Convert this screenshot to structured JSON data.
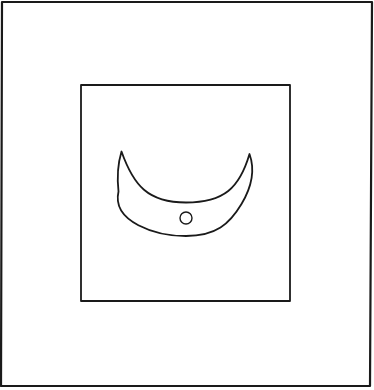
{
  "figure": {
    "colors": {
      "background": "#ffffff",
      "stroke": "#1a1a1a"
    },
    "outer_frame": {
      "points": [
        [
          2,
          2
        ],
        [
          372,
          2
        ],
        [
          370,
          386
        ],
        [
          1,
          386
        ]
      ],
      "stroke_width": 2.2
    },
    "inner_square": {
      "points": [
        [
          81,
          85
        ],
        [
          290,
          85
        ],
        [
          290,
          301
        ],
        [
          81,
          301
        ]
      ],
      "stroke_width": 1.8
    },
    "crescent": {
      "left_tip": [
        121.5,
        151.5
      ],
      "right_tip": [
        249.5,
        154
      ],
      "inner_bottom": [
        186,
        202.5
      ],
      "outer_bottom": [
        186,
        236
      ],
      "stroke_width": 1.8
    },
    "dot": {
      "cx": 186,
      "cy": 218,
      "r": 6,
      "stroke_width": 1.4
    }
  }
}
